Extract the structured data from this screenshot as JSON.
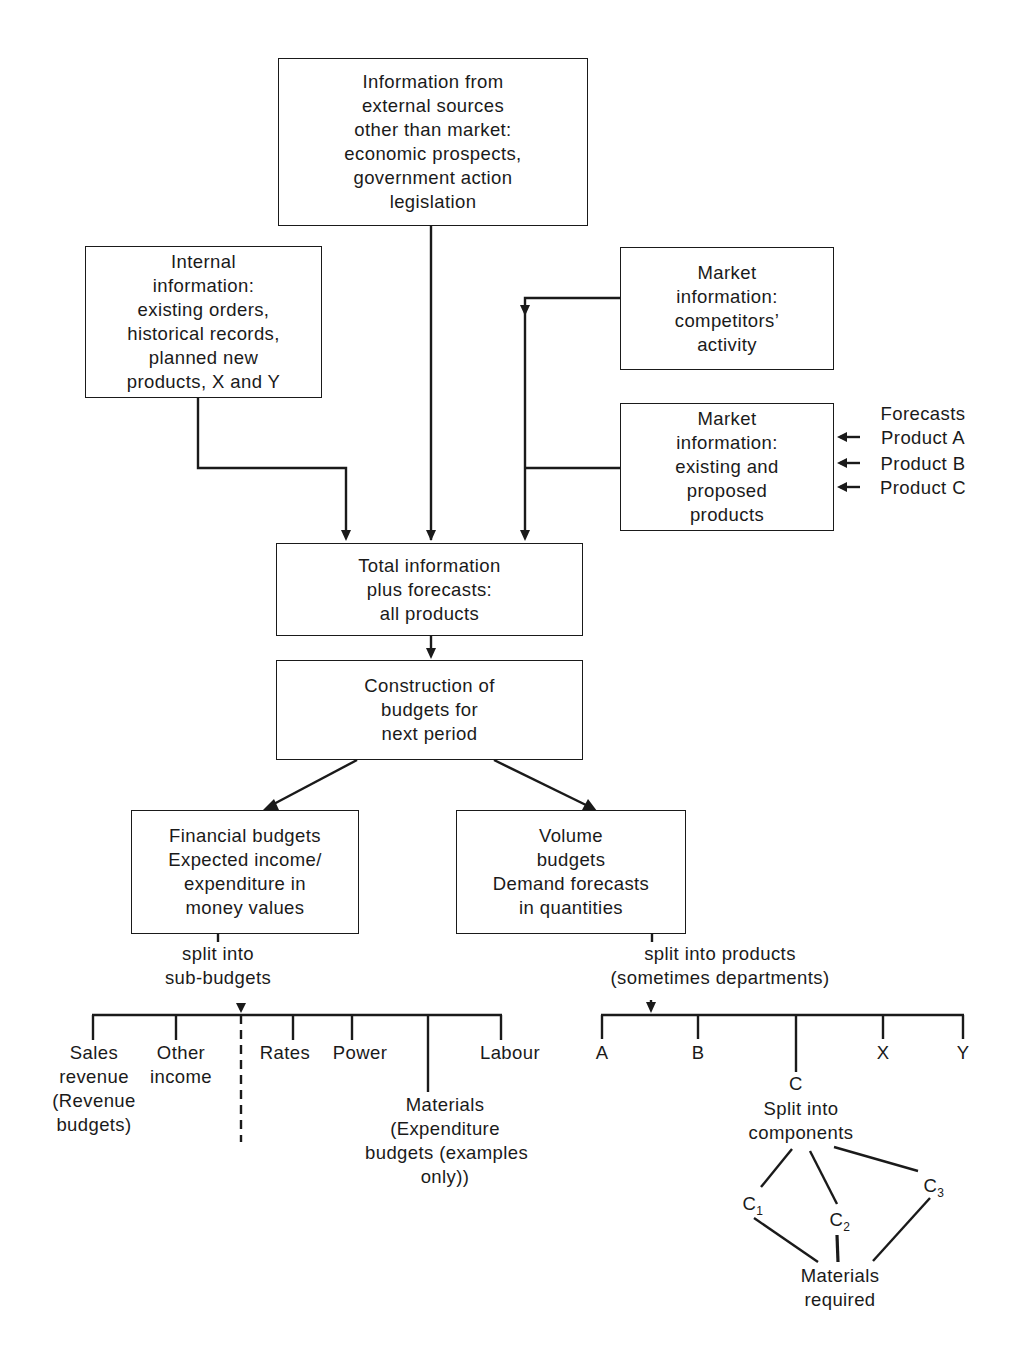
{
  "boxes": {
    "external": {
      "lines": [
        "Information from",
        "external sources",
        "other than market:",
        "economic prospects,",
        "government action",
        "legislation"
      ]
    },
    "internal": {
      "lines": [
        "Internal",
        "information:",
        "existing orders,",
        "historical records,",
        "planned new",
        "products, X and Y"
      ]
    },
    "market_competitors": {
      "lines": [
        "Market",
        "information:",
        "competitors’",
        "activity"
      ]
    },
    "market_products": {
      "lines": [
        "Market",
        "information:",
        "existing and",
        "proposed",
        "products"
      ]
    },
    "total": {
      "lines": [
        "Total information",
        "plus forecasts:",
        "all products"
      ]
    },
    "construction": {
      "lines": [
        "Construction of",
        "budgets for",
        "next period"
      ]
    },
    "financial": {
      "lines": [
        "Financial budgets",
        "Expected income/",
        "expenditure in",
        "money values"
      ]
    },
    "volume": {
      "lines": [
        "Volume",
        "budgets",
        "Demand forecasts",
        "in quantities"
      ]
    }
  },
  "forecasts": {
    "title": "Forecasts",
    "items": [
      "Product A",
      "Product B",
      "Product C"
    ]
  },
  "financial_split": {
    "label": [
      "split into",
      "sub-budgets"
    ],
    "branches": {
      "sales": [
        "Sales",
        "revenue",
        "(Revenue",
        "budgets)"
      ],
      "other": [
        "Other",
        "income"
      ],
      "rates": [
        "Rates"
      ],
      "power": [
        "Power"
      ],
      "materials": [
        "Materials",
        "(Expenditure",
        "budgets (examples",
        "only))"
      ],
      "labour": [
        "Labour"
      ]
    }
  },
  "volume_split": {
    "label": [
      "split into products",
      "(sometimes departments)"
    ],
    "products": [
      "A",
      "B",
      "C",
      "X",
      "Y"
    ],
    "c_split": [
      "Split into",
      "components"
    ],
    "components": [
      "C",
      "C",
      "C"
    ],
    "component_subs": [
      "1",
      "2",
      "3"
    ],
    "materials_required": [
      "Materials",
      "required"
    ]
  }
}
